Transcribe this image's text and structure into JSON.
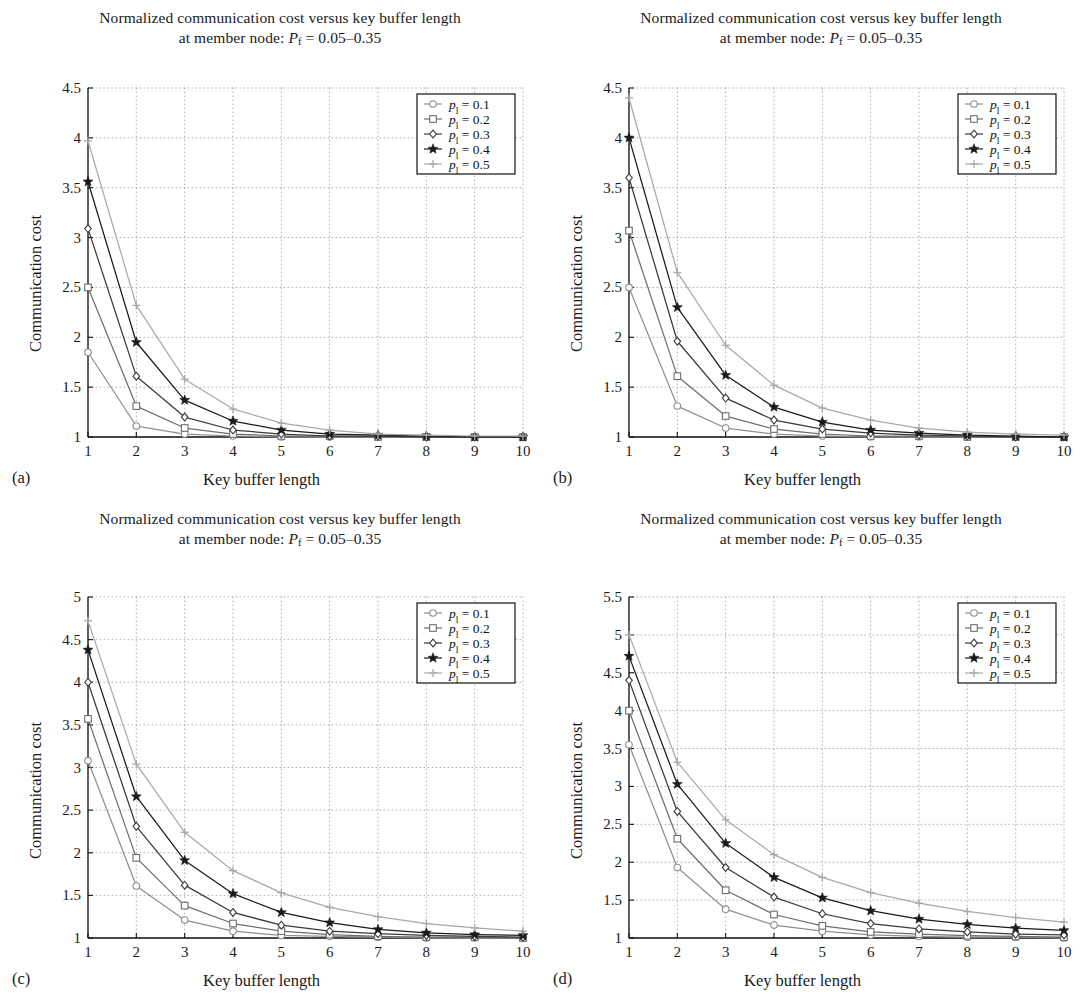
{
  "figure": {
    "width": 1082,
    "height": 1003,
    "panel_count": 4,
    "shared_title_line1": "Normalized communication cost versus key buffer length",
    "shared_title_line2_prefix": "at member node: ",
    "shared_title_line2_symbol": "P",
    "shared_title_line2_subscript": "f",
    "shared_title_line2_value": " = 0.05–0.35",
    "xlabel": "Key buffer length",
    "ylabel": "Communication cost",
    "xticks": [
      1,
      2,
      3,
      4,
      5,
      6,
      7,
      8,
      9,
      10
    ],
    "legend_symbol": "p",
    "legend_subscript": "l",
    "series_names": [
      "p l = 0.1",
      "p l = 0.2",
      "p l = 0.3",
      "p l = 0.4",
      "p l = 0.5"
    ],
    "series_values": [
      "0.1",
      "0.2",
      "0.3",
      "0.4",
      "0.5"
    ],
    "series_markers": [
      "circle",
      "square",
      "diamond",
      "star",
      "plus"
    ],
    "series_colors": [
      "#8f8f8f",
      "#6e6e6e",
      "#3a3a3a",
      "#1a1a1a",
      "#a9a9a9"
    ],
    "grid": "dotted",
    "legend_position": "top-right"
  },
  "chart_data": [
    {
      "id": "a",
      "caption": "(a)",
      "type": "line",
      "title": "Normalized communication cost versus key buffer length at member node: Pf = 0.05–0.35",
      "xlabel": "Key buffer length",
      "ylabel": "Communication cost",
      "x": [
        1,
        2,
        3,
        4,
        5,
        6,
        7,
        8,
        9,
        10
      ],
      "xlim": [
        1,
        10
      ],
      "ylim": [
        1,
        4.5
      ],
      "yticks": [
        1,
        1.5,
        2,
        2.5,
        3,
        3.5,
        4,
        4.5
      ],
      "series": [
        {
          "name": "pl = 0.1",
          "marker": "circle",
          "values": [
            1.85,
            1.11,
            1.03,
            1.01,
            1.0,
            1.0,
            1.0,
            1.0,
            1.0,
            1.0
          ]
        },
        {
          "name": "pl = 0.2",
          "marker": "square",
          "values": [
            2.5,
            1.31,
            1.09,
            1.03,
            1.01,
            1.01,
            1.0,
            1.0,
            1.0,
            1.0
          ]
        },
        {
          "name": "pl = 0.3",
          "marker": "diamond",
          "values": [
            3.09,
            1.61,
            1.2,
            1.07,
            1.03,
            1.01,
            1.01,
            1.0,
            1.0,
            1.0
          ]
        },
        {
          "name": "pl = 0.4",
          "marker": "star",
          "values": [
            3.56,
            1.95,
            1.37,
            1.16,
            1.07,
            1.03,
            1.02,
            1.01,
            1.0,
            1.0
          ]
        },
        {
          "name": "pl = 0.5",
          "marker": "plus",
          "values": [
            3.97,
            2.32,
            1.58,
            1.28,
            1.14,
            1.07,
            1.03,
            1.02,
            1.01,
            1.01
          ]
        }
      ]
    },
    {
      "id": "b",
      "caption": "(b)",
      "type": "line",
      "title": "Normalized communication cost versus key buffer length at member node: Pf = 0.05–0.35",
      "xlabel": "Key buffer length",
      "ylabel": "Communication cost",
      "x": [
        1,
        2,
        3,
        4,
        5,
        6,
        7,
        8,
        9,
        10
      ],
      "xlim": [
        1,
        10
      ],
      "ylim": [
        1,
        4.5
      ],
      "yticks": [
        1,
        1.5,
        2,
        2.5,
        3,
        3.5,
        4,
        4.5
      ],
      "series": [
        {
          "name": "pl = 0.1",
          "marker": "circle",
          "values": [
            2.5,
            1.31,
            1.09,
            1.03,
            1.01,
            1.0,
            1.0,
            1.0,
            1.0,
            1.0
          ]
        },
        {
          "name": "pl = 0.2",
          "marker": "square",
          "values": [
            3.07,
            1.61,
            1.21,
            1.08,
            1.03,
            1.01,
            1.01,
            1.0,
            1.0,
            1.0
          ]
        },
        {
          "name": "pl = 0.3",
          "marker": "diamond",
          "values": [
            3.6,
            1.96,
            1.39,
            1.17,
            1.08,
            1.04,
            1.02,
            1.01,
            1.0,
            1.0
          ]
        },
        {
          "name": "pl = 0.4",
          "marker": "star",
          "values": [
            4.0,
            2.3,
            1.62,
            1.3,
            1.15,
            1.07,
            1.04,
            1.02,
            1.01,
            1.0
          ]
        },
        {
          "name": "pl = 0.5",
          "marker": "plus",
          "values": [
            4.4,
            2.65,
            1.92,
            1.52,
            1.29,
            1.17,
            1.09,
            1.05,
            1.03,
            1.02
          ]
        }
      ]
    },
    {
      "id": "c",
      "caption": "(c)",
      "type": "line",
      "title": "Normalized communication cost versus key buffer length at member node: Pf = 0.05–0.35",
      "xlabel": "Key buffer length",
      "ylabel": "Communication cost",
      "x": [
        1,
        2,
        3,
        4,
        5,
        6,
        7,
        8,
        9,
        10
      ],
      "xlim": [
        1,
        10
      ],
      "ylim": [
        1,
        5
      ],
      "yticks": [
        1,
        1.5,
        2,
        2.5,
        3,
        3.5,
        4,
        4.5,
        5
      ],
      "series": [
        {
          "name": "pl = 0.1",
          "marker": "circle",
          "values": [
            3.08,
            1.61,
            1.21,
            1.08,
            1.03,
            1.02,
            1.01,
            1.0,
            1.0,
            1.0
          ]
        },
        {
          "name": "pl = 0.2",
          "marker": "square",
          "values": [
            3.57,
            1.94,
            1.38,
            1.17,
            1.08,
            1.04,
            1.02,
            1.01,
            1.01,
            1.0
          ]
        },
        {
          "name": "pl = 0.3",
          "marker": "diamond",
          "values": [
            4.0,
            2.31,
            1.62,
            1.3,
            1.15,
            1.08,
            1.05,
            1.03,
            1.02,
            1.01
          ]
        },
        {
          "name": "pl = 0.4",
          "marker": "star",
          "values": [
            4.38,
            2.66,
            1.91,
            1.52,
            1.3,
            1.18,
            1.1,
            1.06,
            1.04,
            1.03
          ]
        },
        {
          "name": "pl = 0.5",
          "marker": "plus",
          "values": [
            4.72,
            3.04,
            2.24,
            1.79,
            1.53,
            1.36,
            1.25,
            1.17,
            1.12,
            1.08
          ]
        }
      ]
    },
    {
      "id": "d",
      "caption": "(d)",
      "type": "line",
      "title": "Normalized communication cost versus key buffer length at member node: Pf = 0.05–0.35",
      "xlabel": "Key buffer length",
      "ylabel": "Communication cost",
      "x": [
        1,
        2,
        3,
        4,
        5,
        6,
        7,
        8,
        9,
        10
      ],
      "xlim": [
        1,
        10
      ],
      "ylim": [
        1,
        5.5
      ],
      "yticks": [
        1,
        1.5,
        2,
        2.5,
        3,
        3.5,
        4,
        4.5,
        5,
        5.5
      ],
      "series": [
        {
          "name": "pl = 0.1",
          "marker": "circle",
          "values": [
            3.55,
            1.93,
            1.38,
            1.17,
            1.09,
            1.04,
            1.02,
            1.01,
            1.01,
            1.0
          ]
        },
        {
          "name": "pl = 0.2",
          "marker": "square",
          "values": [
            4.0,
            2.31,
            1.63,
            1.31,
            1.16,
            1.08,
            1.05,
            1.03,
            1.02,
            1.01
          ]
        },
        {
          "name": "pl = 0.3",
          "marker": "diamond",
          "values": [
            4.4,
            2.67,
            1.93,
            1.54,
            1.32,
            1.19,
            1.12,
            1.08,
            1.05,
            1.04
          ]
        },
        {
          "name": "pl = 0.4",
          "marker": "star",
          "values": [
            4.72,
            3.03,
            2.25,
            1.8,
            1.53,
            1.36,
            1.25,
            1.18,
            1.13,
            1.1
          ]
        },
        {
          "name": "pl = 0.5",
          "marker": "plus",
          "values": [
            5.0,
            3.32,
            2.56,
            2.1,
            1.8,
            1.6,
            1.46,
            1.35,
            1.27,
            1.21
          ]
        }
      ]
    }
  ]
}
